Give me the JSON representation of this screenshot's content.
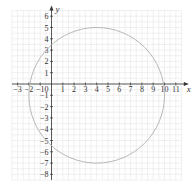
{
  "chart_data": {
    "type": "line",
    "title": "",
    "xlabel": "x",
    "ylabel": "y",
    "xlim": [
      -3.5,
      11.7
    ],
    "ylim": [
      -8.5,
      6.6
    ],
    "grid": true,
    "x_ticks": [
      -3,
      -2,
      -1,
      0,
      1,
      2,
      3,
      4,
      5,
      6,
      7,
      8,
      9,
      10,
      11
    ],
    "y_ticks": [
      -8,
      -7,
      -6,
      -5,
      -4,
      -3,
      -2,
      -1,
      0,
      1,
      2,
      3,
      4,
      5,
      6
    ],
    "series": [
      {
        "name": "circle",
        "shape": "circle",
        "center": [
          4,
          -1
        ],
        "radius": 6,
        "equation": "(x-4)^2 + (y+1)^2 = 36",
        "color": "#b0b0b0"
      }
    ]
  },
  "colors": {
    "grid": "#e6e6e6",
    "axis": "#333333",
    "curve": "#b0b0b0"
  }
}
